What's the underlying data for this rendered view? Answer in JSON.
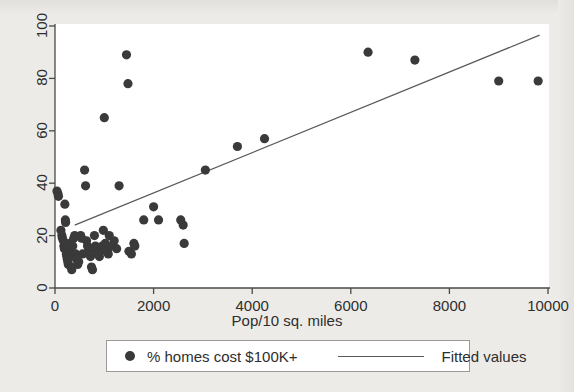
{
  "chart_data": {
    "type": "scatter",
    "title": "",
    "xlabel": "Pop/10 sq. miles",
    "ylabel": "",
    "xlim": [
      0,
      10000
    ],
    "ylim": [
      0,
      100
    ],
    "xticks": [
      0,
      2000,
      4000,
      6000,
      8000,
      10000
    ],
    "xtick_labels": [
      "0",
      "2000",
      "4000",
      "6000",
      "8000",
      "10000"
    ],
    "yticks": [
      0,
      20,
      40,
      60,
      80,
      100
    ],
    "ytick_labels": [
      "0",
      "20",
      "40",
      "60",
      "80",
      "100"
    ],
    "grid": false,
    "legend_position": "below-axes",
    "series": [
      {
        "name": "% homes cost $100K+",
        "type": "scatter",
        "marker": "filled-circle",
        "color": "#3a3a3a",
        "points": [
          [
            40,
            37
          ],
          [
            60,
            36
          ],
          [
            70,
            35
          ],
          [
            120,
            22
          ],
          [
            140,
            20
          ],
          [
            150,
            19
          ],
          [
            170,
            18
          ],
          [
            180,
            16
          ],
          [
            190,
            15
          ],
          [
            200,
            32
          ],
          [
            210,
            26
          ],
          [
            215,
            25
          ],
          [
            230,
            13
          ],
          [
            240,
            12
          ],
          [
            250,
            11
          ],
          [
            260,
            10
          ],
          [
            270,
            9
          ],
          [
            280,
            14
          ],
          [
            300,
            17
          ],
          [
            310,
            15
          ],
          [
            320,
            12
          ],
          [
            330,
            8
          ],
          [
            340,
            7
          ],
          [
            360,
            16
          ],
          [
            380,
            19
          ],
          [
            400,
            20
          ],
          [
            420,
            13
          ],
          [
            440,
            11
          ],
          [
            460,
            9
          ],
          [
            480,
            10
          ],
          [
            520,
            20
          ],
          [
            540,
            19
          ],
          [
            560,
            13
          ],
          [
            600,
            45
          ],
          [
            620,
            39
          ],
          [
            640,
            18
          ],
          [
            660,
            16
          ],
          [
            680,
            14
          ],
          [
            700,
            15
          ],
          [
            720,
            12
          ],
          [
            740,
            8
          ],
          [
            760,
            7
          ],
          [
            800,
            20
          ],
          [
            820,
            16
          ],
          [
            840,
            15
          ],
          [
            860,
            14
          ],
          [
            880,
            13
          ],
          [
            900,
            12
          ],
          [
            920,
            14
          ],
          [
            940,
            15
          ],
          [
            960,
            16
          ],
          [
            980,
            22
          ],
          [
            1000,
            65
          ],
          [
            1020,
            17
          ],
          [
            1060,
            14
          ],
          [
            1080,
            13
          ],
          [
            1100,
            20
          ],
          [
            1150,
            16
          ],
          [
            1200,
            18
          ],
          [
            1250,
            15
          ],
          [
            1300,
            39
          ],
          [
            1450,
            89
          ],
          [
            1480,
            78
          ],
          [
            1500,
            14
          ],
          [
            1550,
            13
          ],
          [
            1600,
            17
          ],
          [
            1620,
            16
          ],
          [
            1800,
            26
          ],
          [
            2000,
            31
          ],
          [
            2100,
            26
          ],
          [
            2550,
            26
          ],
          [
            2600,
            24
          ],
          [
            2620,
            17
          ],
          [
            3050,
            45
          ],
          [
            3700,
            54
          ],
          [
            4250,
            57
          ],
          [
            6350,
            90
          ],
          [
            7300,
            87
          ],
          [
            9000,
            79
          ],
          [
            9800,
            79
          ]
        ]
      },
      {
        "name": "Fitted values",
        "type": "line",
        "color": "#5a5a5a",
        "endpoints": [
          [
            400,
            24
          ],
          [
            9830,
            96.5
          ]
        ]
      }
    ]
  },
  "axes": {
    "x_title": "Pop/10 sq. miles"
  },
  "legend": {
    "points_label": "% homes cost $100K+",
    "line_label": "Fitted values"
  },
  "colors": {
    "marker": "#3a3a3a",
    "line": "#5a5a5a",
    "axis": "#4a4a4a",
    "panel": "#ffffff",
    "page": "#edebe7"
  }
}
